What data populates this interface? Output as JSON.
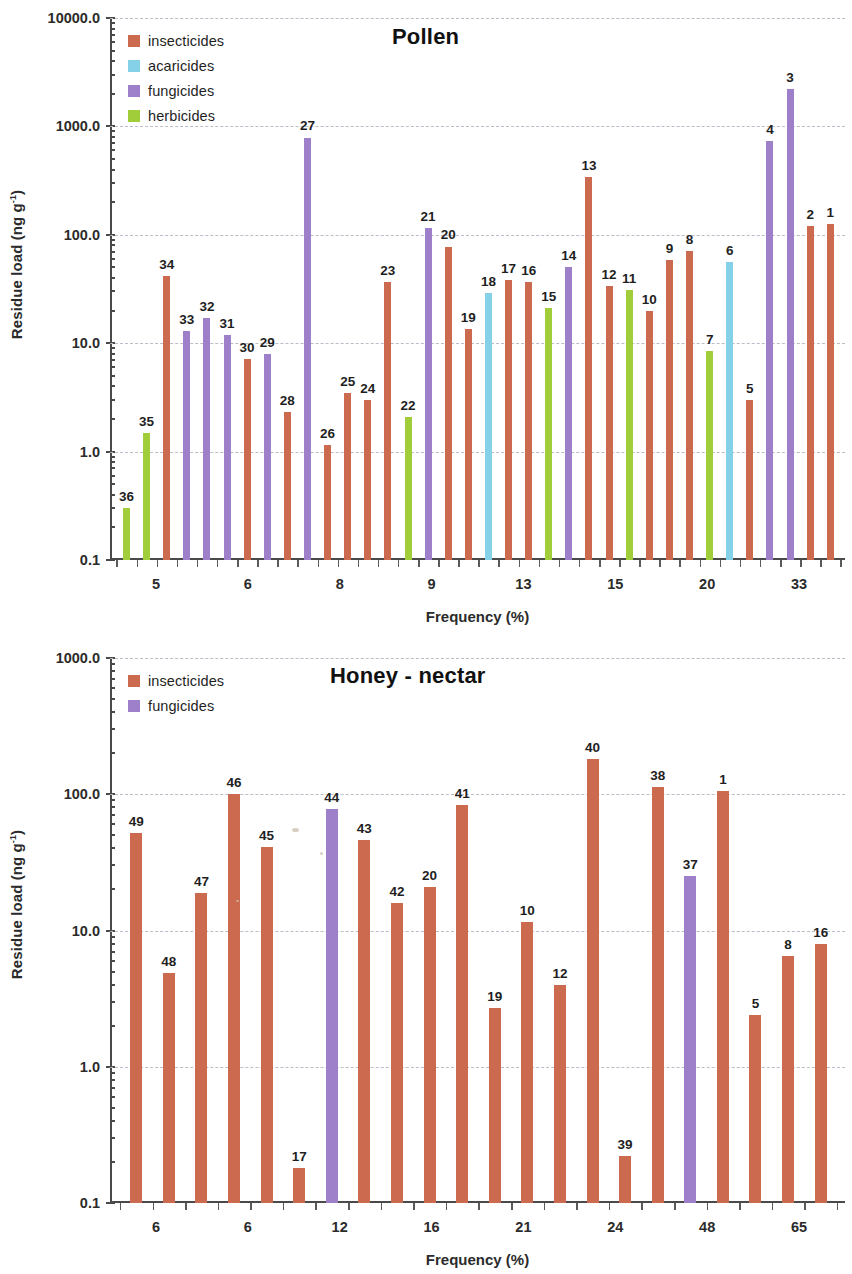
{
  "figure": {
    "panels": [
      "pollen",
      "honey_nectar"
    ]
  },
  "colors": {
    "insecticides": "#CC6A50",
    "acaricides": "#85D2E8",
    "fungicides": "#9D80C9",
    "herbicides": "#A2CD3A",
    "axis": "#4a4a4a",
    "grid": "#b9b9c6",
    "text": "#1f1f1f"
  },
  "pollen": {
    "title": "Pollen",
    "legend": [
      {
        "label": "insecticides",
        "color_key": "insecticides"
      },
      {
        "label": "acaricides",
        "color_key": "acaricides"
      },
      {
        "label": "fungicides",
        "color_key": "fungicides"
      },
      {
        "label": "herbicides",
        "color_key": "herbicides"
      }
    ],
    "ylabel_main": "Residue load (ng g",
    "ylabel_sup": "-1",
    "ylabel_close": ")",
    "xlabel": "Frequency (%)",
    "yticks": [
      "10000.0",
      "1000.0",
      "100.0",
      "10.0",
      "1.0",
      "0.1"
    ],
    "xticks": [
      "5",
      "6",
      "8",
      "9",
      "13",
      "15",
      "20",
      "33"
    ]
  },
  "honey": {
    "title": "Honey - nectar",
    "legend": [
      {
        "label": "insecticides",
        "color_key": "insecticides"
      },
      {
        "label": "fungicides",
        "color_key": "fungicides"
      }
    ],
    "ylabel_main": "Residue load (ng g",
    "ylabel_sup": "-1",
    "ylabel_close": ")",
    "xlabel": "Frequency (%)",
    "yticks": [
      "1000.0",
      "100.0",
      "10.0",
      "1.0",
      "0.1"
    ],
    "xticks": [
      "6",
      "6",
      "12",
      "16",
      "21",
      "24",
      "48",
      "65"
    ]
  },
  "chart_data": [
    {
      "type": "bar",
      "title": "Pollen",
      "xlabel": "Frequency (%)",
      "ylabel": "Residue load (ng g-1)",
      "yscale": "log",
      "ylim": [
        0.1,
        10000
      ],
      "ytick_values": [
        0.1,
        1,
        10,
        100,
        1000,
        10000
      ],
      "ytick_labels": [
        "0.1",
        "1.0",
        "10.0",
        "100.0",
        "1000.0",
        "10000.0"
      ],
      "xtick_labels": [
        "5",
        "6",
        "8",
        "9",
        "13",
        "15",
        "20",
        "33"
      ],
      "grid": "horizontal-dashed",
      "legend_position": "top-left",
      "legend_entries": [
        "insecticides",
        "acaricides",
        "fungicides",
        "herbicides"
      ],
      "bars": [
        {
          "label": "36",
          "value": 0.3,
          "class": "herbicides"
        },
        {
          "label": "35",
          "value": 1.5,
          "class": "herbicides"
        },
        {
          "label": "34",
          "value": 42,
          "class": "insecticides"
        },
        {
          "label": "33",
          "value": 13,
          "class": "fungicides"
        },
        {
          "label": "32",
          "value": 17,
          "class": "fungicides"
        },
        {
          "label": "31",
          "value": 12,
          "class": "fungicides"
        },
        {
          "label": "30",
          "value": 7.2,
          "class": "insecticides"
        },
        {
          "label": "29",
          "value": 8.0,
          "class": "fungicides"
        },
        {
          "label": "28",
          "value": 2.3,
          "class": "insecticides"
        },
        {
          "label": "27",
          "value": 790,
          "class": "fungicides"
        },
        {
          "label": "26",
          "value": 1.15,
          "class": "insecticides"
        },
        {
          "label": "25",
          "value": 3.5,
          "class": "insecticides"
        },
        {
          "label": "24",
          "value": 3.0,
          "class": "insecticides"
        },
        {
          "label": "23",
          "value": 37,
          "class": "insecticides"
        },
        {
          "label": "22",
          "value": 2.1,
          "class": "herbicides"
        },
        {
          "label": "21",
          "value": 115,
          "class": "fungicides"
        },
        {
          "label": "20",
          "value": 78,
          "class": "insecticides"
        },
        {
          "label": "19",
          "value": 13.5,
          "class": "insecticides"
        },
        {
          "label": "18",
          "value": 29,
          "class": "acaricides"
        },
        {
          "label": "17",
          "value": 38,
          "class": "insecticides"
        },
        {
          "label": "16",
          "value": 37,
          "class": "insecticides"
        },
        {
          "label": "15",
          "value": 21,
          "class": "herbicides"
        },
        {
          "label": "14",
          "value": 50,
          "class": "fungicides"
        },
        {
          "label": "13",
          "value": 340,
          "class": "insecticides"
        },
        {
          "label": "12",
          "value": 34,
          "class": "insecticides"
        },
        {
          "label": "11",
          "value": 31,
          "class": "herbicides"
        },
        {
          "label": "10",
          "value": 20,
          "class": "insecticides"
        },
        {
          "label": "9",
          "value": 58,
          "class": "insecticides"
        },
        {
          "label": "8",
          "value": 71,
          "class": "insecticides"
        },
        {
          "label": "7",
          "value": 8.5,
          "class": "herbicides"
        },
        {
          "label": "6",
          "value": 56,
          "class": "acaricides"
        },
        {
          "label": "5",
          "value": 3.0,
          "class": "insecticides"
        },
        {
          "label": "4",
          "value": 740,
          "class": "fungicides"
        },
        {
          "label": "3",
          "value": 2200,
          "class": "fungicides"
        },
        {
          "label": "2",
          "value": 120,
          "class": "insecticides"
        },
        {
          "label": "1",
          "value": 127,
          "class": "insecticides"
        }
      ]
    },
    {
      "type": "bar",
      "title": "Honey - nectar",
      "xlabel": "Frequency (%)",
      "ylabel": "Residue load (ng g-1)",
      "yscale": "log",
      "ylim": [
        0.1,
        1000
      ],
      "ytick_values": [
        0.1,
        1,
        10,
        100,
        1000
      ],
      "ytick_labels": [
        "0.1",
        "1.0",
        "10.0",
        "100.0",
        "1000.0"
      ],
      "xtick_labels": [
        "6",
        "6",
        "12",
        "16",
        "21",
        "24",
        "48",
        "65"
      ],
      "grid": "horizontal-dashed",
      "legend_position": "top-left",
      "legend_entries": [
        "insecticides",
        "fungicides"
      ],
      "bars": [
        {
          "label": "49",
          "value": 52,
          "class": "insecticides"
        },
        {
          "label": "48",
          "value": 4.9,
          "class": "insecticides"
        },
        {
          "label": "47",
          "value": 19,
          "class": "insecticides"
        },
        {
          "label": "46",
          "value": 101,
          "class": "insecticides"
        },
        {
          "label": "45",
          "value": 41,
          "class": "insecticides"
        },
        {
          "label": "17",
          "value": 0.18,
          "class": "insecticides"
        },
        {
          "label": "44",
          "value": 78,
          "class": "fungicides"
        },
        {
          "label": "43",
          "value": 46,
          "class": "insecticides"
        },
        {
          "label": "42",
          "value": 16,
          "class": "insecticides"
        },
        {
          "label": "20",
          "value": 21,
          "class": "insecticides"
        },
        {
          "label": "41",
          "value": 83,
          "class": "insecticides"
        },
        {
          "label": "19",
          "value": 2.7,
          "class": "insecticides"
        },
        {
          "label": "10",
          "value": 11.5,
          "class": "insecticides"
        },
        {
          "label": "12",
          "value": 4.0,
          "class": "insecticides"
        },
        {
          "label": "40",
          "value": 180,
          "class": "insecticides"
        },
        {
          "label": "39",
          "value": 0.22,
          "class": "insecticides"
        },
        {
          "label": "38",
          "value": 113,
          "class": "insecticides"
        },
        {
          "label": "37",
          "value": 25,
          "class": "fungicides"
        },
        {
          "label": "1",
          "value": 105,
          "class": "insecticides"
        },
        {
          "label": "5",
          "value": 2.4,
          "class": "insecticides"
        },
        {
          "label": "8",
          "value": 6.5,
          "class": "insecticides"
        },
        {
          "label": "16",
          "value": 8.0,
          "class": "insecticides"
        }
      ]
    }
  ]
}
